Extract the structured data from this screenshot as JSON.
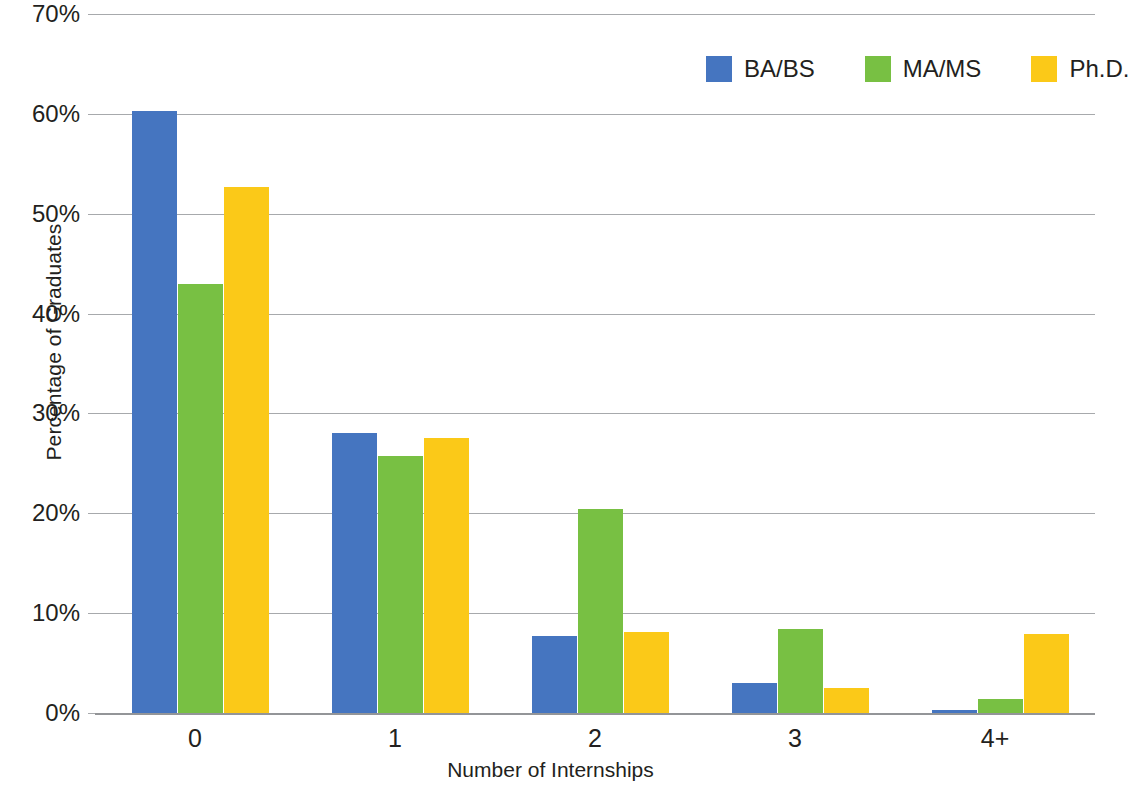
{
  "chart_data": {
    "type": "bar",
    "title": "",
    "xlabel": "Number of Internships",
    "ylabel": "Percentage of Graduates",
    "categories": [
      "0",
      "1",
      "2",
      "3",
      "4+"
    ],
    "ytick_labels": [
      "0%",
      "10%",
      "20%",
      "30%",
      "40%",
      "50%",
      "60%",
      "70%"
    ],
    "ytick_values": [
      0,
      10,
      20,
      30,
      40,
      50,
      60,
      70
    ],
    "ylim": [
      0,
      70
    ],
    "grid": true,
    "legend_position": "top-right",
    "series": [
      {
        "name": "BA/BS",
        "color": "#4575c0",
        "values": [
          60.3,
          28.0,
          7.7,
          3.0,
          0.3
        ]
      },
      {
        "name": "MA/MS",
        "color": "#78c043",
        "values": [
          43.0,
          25.7,
          20.4,
          8.4,
          1.4
        ]
      },
      {
        "name": "Ph.D.",
        "color": "#fbc918",
        "values": [
          52.7,
          27.5,
          8.1,
          2.5,
          7.9
        ]
      }
    ]
  },
  "legend": {
    "items": [
      {
        "label": "BA/BS",
        "color": "#4575c0"
      },
      {
        "label": "MA/MS",
        "color": "#78c043"
      },
      {
        "label": "Ph.D.",
        "color": "#fbc918"
      }
    ]
  },
  "axes": {
    "y_title": "Percentage of Graduates",
    "x_title": "Number of Internships"
  },
  "colors": {
    "grid": "#a7a9ac",
    "axis": "#939598",
    "text": "#231f20",
    "background": "#ffffff"
  }
}
